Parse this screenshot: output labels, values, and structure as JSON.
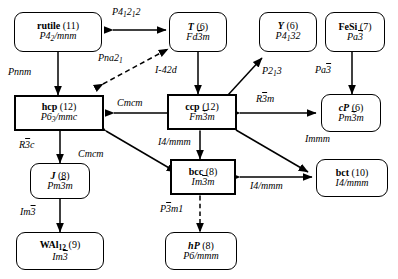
{
  "figure": {
    "type": "crystal-structure-group-subgroup-diagram",
    "nodes": [
      {
        "id": "rutile",
        "name": "rutile",
        "count": "(11)",
        "group": "P4₂/mnm",
        "shape": "rounded"
      },
      {
        "id": "T",
        "name": "T",
        "count": "(6)",
        "group": "Fd3̅m",
        "shape": "rounded"
      },
      {
        "id": "Y",
        "name": "Y",
        "count": "(6)",
        "group": "P4₁32",
        "shape": "rounded"
      },
      {
        "id": "FeSi",
        "name": "FeSi",
        "count": "(7)",
        "group": "Pa3̅",
        "shape": "rounded"
      },
      {
        "id": "hcp",
        "name": "hcp",
        "count": "(12)",
        "group": "P6₃/mmc",
        "shape": "rect"
      },
      {
        "id": "ccp",
        "name": "ccp",
        "count": "(12)",
        "group": "Fm3̅m",
        "shape": "rect"
      },
      {
        "id": "cP",
        "name": "cP",
        "count": "(6)",
        "group": "Pm3̅m",
        "shape": "rounded"
      },
      {
        "id": "bcc",
        "name": "bcc",
        "count": "(8)",
        "group": "Im3̅m",
        "shape": "rect"
      },
      {
        "id": "bct",
        "name": "bct",
        "count": "(10)",
        "group": "I4/mmm",
        "shape": "rounded"
      },
      {
        "id": "J",
        "name": "J",
        "count": "(8)",
        "group": "Pm3̅m",
        "shape": "rounded"
      },
      {
        "id": "WAl12",
        "name": "WAl₁₂",
        "count": "(9)",
        "group": "Im3̅",
        "shape": "rounded"
      },
      {
        "id": "hP",
        "name": "hP",
        "count": "(8)",
        "group": "P6/mmm",
        "shape": "rounded"
      }
    ],
    "edge_labels": {
      "rutile_T": "P4₁2₁2",
      "rutile_hcp": "Pnnm",
      "hcp_T": "Pna2₁",
      "T_ccp": "I-42d",
      "hcp_ccp": "Cmcm",
      "ccp_Y": "P2₁3",
      "FeSi_cP": "Pa3̅",
      "ccp_cP": "R3̅m",
      "ccp_bcc": "I4/mmm",
      "ccp_bct": "Immm",
      "bcc_bct": "I4/mmm",
      "hcp_bcc": "Cmcm",
      "hcp_J": "R3̅c",
      "J_WAl12": "Im3̅",
      "bcc_hP": "P3̅m1"
    }
  }
}
